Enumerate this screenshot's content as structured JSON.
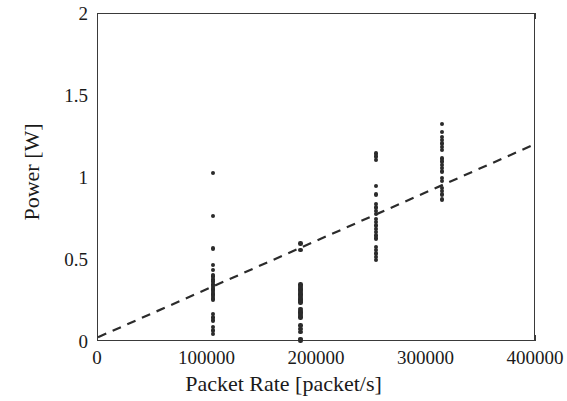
{
  "chart_data": {
    "type": "scatter",
    "title": "",
    "xlabel": "Packet Rate [packet/s]",
    "ylabel": "Power [W]",
    "xlim": [
      0,
      400000
    ],
    "ylim": [
      0,
      2
    ],
    "xticks": [
      0,
      100000,
      200000,
      300000,
      400000
    ],
    "xticklabels": [
      "0",
      "100000",
      "200000",
      "300000",
      "400000"
    ],
    "yticks": [
      0,
      0.5,
      1,
      1.5,
      2
    ],
    "yticklabels": [
      "0",
      "0.5",
      "1",
      "1.5",
      "2"
    ],
    "grid": false,
    "legend": null,
    "marker_color": "#2b2b2b",
    "line_color": "#2b2b2b",
    "series": [
      {
        "name": "Measured power samples",
        "type": "scatter",
        "points": [
          [
            105000,
            1.03
          ],
          [
            105000,
            0.77
          ],
          [
            105000,
            0.57
          ],
          [
            105000,
            0.47
          ],
          [
            105000,
            0.44
          ],
          [
            105000,
            0.41
          ],
          [
            105000,
            0.4
          ],
          [
            105000,
            0.38
          ],
          [
            105000,
            0.37
          ],
          [
            105000,
            0.35
          ],
          [
            105000,
            0.34
          ],
          [
            105000,
            0.33
          ],
          [
            105000,
            0.32
          ],
          [
            105000,
            0.31
          ],
          [
            105000,
            0.3
          ],
          [
            105000,
            0.29
          ],
          [
            105000,
            0.28
          ],
          [
            105000,
            0.27
          ],
          [
            105000,
            0.26
          ],
          [
            105000,
            0.17
          ],
          [
            105000,
            0.15
          ],
          [
            105000,
            0.13
          ],
          [
            105000,
            0.09
          ],
          [
            105000,
            0.07
          ],
          [
            105000,
            0.05
          ],
          [
            185000,
            0.6
          ],
          [
            185000,
            0.56
          ],
          [
            185000,
            0.35
          ],
          [
            185000,
            0.34
          ],
          [
            185000,
            0.33
          ],
          [
            185000,
            0.32
          ],
          [
            185000,
            0.31
          ],
          [
            185000,
            0.3
          ],
          [
            185000,
            0.29
          ],
          [
            185000,
            0.28
          ],
          [
            185000,
            0.27
          ],
          [
            185000,
            0.26
          ],
          [
            185000,
            0.25
          ],
          [
            185000,
            0.24
          ],
          [
            185000,
            0.2
          ],
          [
            185000,
            0.19
          ],
          [
            185000,
            0.18
          ],
          [
            185000,
            0.17
          ],
          [
            185000,
            0.16
          ],
          [
            185000,
            0.15
          ],
          [
            185000,
            0.1
          ],
          [
            185000,
            0.08
          ],
          [
            185000,
            0.06
          ],
          [
            185000,
            0.02
          ],
          [
            185000,
            0.01
          ],
          [
            254000,
            1.15
          ],
          [
            254000,
            1.13
          ],
          [
            254000,
            1.11
          ],
          [
            254000,
            0.95
          ],
          [
            254000,
            0.9
          ],
          [
            254000,
            0.84
          ],
          [
            254000,
            0.82
          ],
          [
            254000,
            0.8
          ],
          [
            254000,
            0.78
          ],
          [
            254000,
            0.75
          ],
          [
            254000,
            0.73
          ],
          [
            254000,
            0.71
          ],
          [
            254000,
            0.69
          ],
          [
            254000,
            0.67
          ],
          [
            254000,
            0.65
          ],
          [
            254000,
            0.63
          ],
          [
            254000,
            0.58
          ],
          [
            254000,
            0.56
          ],
          [
            254000,
            0.54
          ],
          [
            254000,
            0.52
          ],
          [
            254000,
            0.5
          ],
          [
            314000,
            1.33
          ],
          [
            314000,
            1.28
          ],
          [
            314000,
            1.25
          ],
          [
            314000,
            1.23
          ],
          [
            314000,
            1.21
          ],
          [
            314000,
            1.19
          ],
          [
            314000,
            1.17
          ],
          [
            314000,
            1.12
          ],
          [
            314000,
            1.1
          ],
          [
            314000,
            1.08
          ],
          [
            314000,
            1.06
          ],
          [
            314000,
            1.04
          ],
          [
            314000,
            1.0
          ],
          [
            314000,
            0.98
          ],
          [
            314000,
            0.94
          ],
          [
            314000,
            0.92
          ],
          [
            314000,
            0.9
          ],
          [
            314000,
            0.87
          ]
        ]
      },
      {
        "name": "Linear fit",
        "type": "line",
        "style": "dashed",
        "x": [
          0,
          400000
        ],
        "y": [
          0.02,
          1.2
        ]
      }
    ]
  }
}
